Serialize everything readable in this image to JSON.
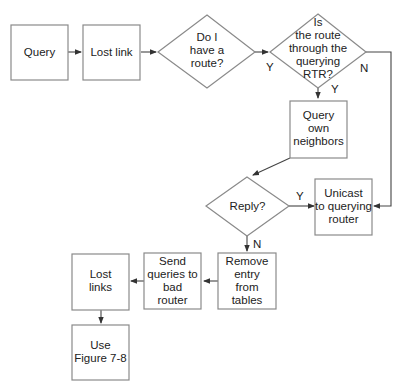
{
  "diagram": {
    "type": "flowchart",
    "colors": {
      "stroke": "#8a8a8a",
      "edge": "#444444",
      "text": "#222222",
      "background": "#ffffff"
    },
    "nodes": {
      "query": {
        "shape": "process",
        "lines": [
          "Query"
        ]
      },
      "lost_link": {
        "shape": "process",
        "lines": [
          "Lost link"
        ]
      },
      "have_route": {
        "shape": "decision",
        "lines": [
          "Do I",
          "have a",
          "route?"
        ]
      },
      "route_through_rtr": {
        "shape": "decision",
        "lines": [
          "Is",
          "the route",
          "through the",
          "querying",
          "RTR?"
        ]
      },
      "query_neighbors": {
        "shape": "process",
        "lines": [
          "Query",
          "own",
          "neighbors"
        ]
      },
      "reply": {
        "shape": "decision",
        "lines": [
          "Reply?"
        ]
      },
      "unicast": {
        "shape": "process",
        "lines": [
          "Unicast",
          "to querying",
          "router"
        ]
      },
      "remove_entry": {
        "shape": "process",
        "lines": [
          "Remove",
          "entry",
          "from",
          "tables"
        ]
      },
      "send_queries": {
        "shape": "process",
        "lines": [
          "Send",
          "queries to",
          "bad",
          "router"
        ]
      },
      "lost_links": {
        "shape": "process",
        "lines": [
          "Lost",
          "links"
        ]
      },
      "use_figure": {
        "shape": "process",
        "lines": [
          "Use",
          "Figure 7-8"
        ]
      }
    },
    "edges": [
      {
        "from": "query",
        "to": "lost_link",
        "label": ""
      },
      {
        "from": "lost_link",
        "to": "have_route",
        "label": ""
      },
      {
        "from": "have_route",
        "to": "route_through_rtr",
        "label": "Y"
      },
      {
        "from": "route_through_rtr",
        "to": "query_neighbors",
        "label": "Y"
      },
      {
        "from": "route_through_rtr",
        "to": "unicast",
        "label": "N"
      },
      {
        "from": "query_neighbors",
        "to": "reply",
        "label": ""
      },
      {
        "from": "reply",
        "to": "unicast",
        "label": "Y"
      },
      {
        "from": "reply",
        "to": "remove_entry",
        "label": "N"
      },
      {
        "from": "remove_entry",
        "to": "send_queries",
        "label": ""
      },
      {
        "from": "send_queries",
        "to": "lost_links",
        "label": ""
      },
      {
        "from": "lost_links",
        "to": "use_figure",
        "label": ""
      }
    ]
  }
}
